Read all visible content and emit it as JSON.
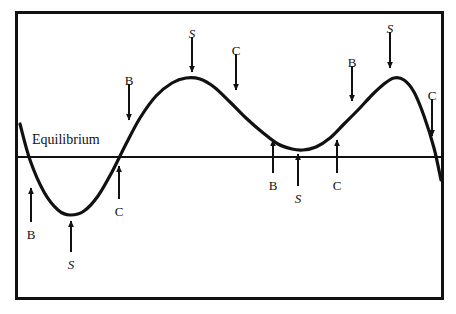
{
  "figure": {
    "title": "",
    "equilibrium_label": "Equilibrium",
    "frame": {
      "x": 15,
      "y": 11,
      "width": 429,
      "height": 289,
      "border_color": "#111111",
      "border_width": 3
    },
    "background_color": "#ffffff",
    "curve_color": "#111111",
    "curve_width": 3,
    "equilibrium_line": {
      "y": 157,
      "x_start": 18,
      "x_end": 441,
      "color": "#111111",
      "width": 2
    }
  },
  "chart_data": {
    "type": "line",
    "title": "",
    "xlabel": "",
    "ylabel": "",
    "grid": false,
    "legend": "none",
    "equilibrium_level": 157,
    "xlim": [
      18,
      441
    ],
    "ylim": [
      11,
      300
    ],
    "series": [
      {
        "name": "market-cycle-wave",
        "path_points": [
          [
            20,
            124
          ],
          [
            30,
            160
          ],
          [
            44,
            192
          ],
          [
            58,
            210
          ],
          [
            70,
            215
          ],
          [
            84,
            211
          ],
          [
            98,
            196
          ],
          [
            112,
            172
          ],
          [
            126,
            144
          ],
          [
            140,
            118
          ],
          [
            156,
            96
          ],
          [
            172,
            83
          ],
          [
            186,
            78
          ],
          [
            200,
            79
          ],
          [
            214,
            87
          ],
          [
            230,
            102
          ],
          [
            246,
            118
          ],
          [
            262,
            132
          ],
          [
            278,
            144
          ],
          [
            292,
            149
          ],
          [
            303,
            150
          ],
          [
            316,
            147
          ],
          [
            330,
            138
          ],
          [
            344,
            124
          ],
          [
            358,
            110
          ],
          [
            372,
            95
          ],
          [
            384,
            84
          ],
          [
            394,
            78
          ],
          [
            404,
            80
          ],
          [
            414,
            92
          ],
          [
            424,
            116
          ],
          [
            434,
            148
          ],
          [
            441,
            180
          ]
        ],
        "features": {
          "first_trough": [
            70,
            215
          ],
          "first_peak": [
            193,
            78
          ],
          "middle_trough": [
            303,
            150
          ],
          "second_peak": [
            394,
            78
          ],
          "crossings": [
            [
              32,
              157
            ],
            [
              113,
              157
            ],
            [
              437,
              157
            ]
          ]
        }
      }
    ],
    "annotations": [
      {
        "id": "a1",
        "label": "B",
        "italic": false,
        "phase": "buy",
        "label_x": 31,
        "label_y": 228,
        "arrow_x": 31,
        "arrow_from_y": 222,
        "arrow_to_y": 188,
        "direction": "up"
      },
      {
        "id": "a2",
        "label": "S",
        "italic": true,
        "phase": "sell",
        "label_x": 71,
        "label_y": 258,
        "arrow_x": 71,
        "arrow_from_y": 252,
        "arrow_to_y": 221,
        "direction": "up"
      },
      {
        "id": "a3",
        "label": "C",
        "italic": false,
        "phase": "cross",
        "label_x": 119,
        "label_y": 205,
        "arrow_x": 119,
        "arrow_from_y": 199,
        "arrow_to_y": 166,
        "direction": "up"
      },
      {
        "id": "a4",
        "label": "B",
        "italic": false,
        "phase": "buy",
        "label_x": 129,
        "label_y": 74,
        "arrow_x": 129,
        "arrow_from_y": 84,
        "arrow_to_y": 120,
        "direction": "down"
      },
      {
        "id": "a5",
        "label": "S",
        "italic": true,
        "phase": "sell",
        "label_x": 192,
        "label_y": 27,
        "arrow_x": 192,
        "arrow_from_y": 37,
        "arrow_to_y": 72,
        "direction": "down"
      },
      {
        "id": "a6",
        "label": "C",
        "italic": false,
        "phase": "cross",
        "label_x": 236,
        "label_y": 44,
        "arrow_x": 236,
        "arrow_from_y": 54,
        "arrow_to_y": 90,
        "direction": "down"
      },
      {
        "id": "a7",
        "label": "B",
        "italic": false,
        "phase": "buy",
        "label_x": 273,
        "label_y": 179,
        "arrow_x": 273,
        "arrow_from_y": 173,
        "arrow_to_y": 140,
        "direction": "up"
      },
      {
        "id": "a8",
        "label": "S",
        "italic": true,
        "phase": "sell",
        "label_x": 298,
        "label_y": 192,
        "arrow_x": 298,
        "arrow_from_y": 186,
        "arrow_to_y": 154,
        "direction": "up"
      },
      {
        "id": "a9",
        "label": "C",
        "italic": false,
        "phase": "cross",
        "label_x": 337,
        "label_y": 179,
        "arrow_x": 337,
        "arrow_from_y": 173,
        "arrow_to_y": 140,
        "direction": "up"
      },
      {
        "id": "a10",
        "label": "B",
        "italic": false,
        "phase": "buy",
        "label_x": 352,
        "label_y": 56,
        "arrow_x": 352,
        "arrow_from_y": 66,
        "arrow_to_y": 101,
        "direction": "down"
      },
      {
        "id": "a11",
        "label": "S",
        "italic": true,
        "phase": "sell",
        "label_x": 390,
        "label_y": 22,
        "arrow_x": 390,
        "arrow_from_y": 32,
        "arrow_to_y": 68,
        "direction": "down"
      },
      {
        "id": "a12",
        "label": "C",
        "italic": false,
        "phase": "cross",
        "label_x": 432,
        "label_y": 89,
        "arrow_x": 432,
        "arrow_from_y": 99,
        "arrow_to_y": 136,
        "direction": "down"
      }
    ]
  }
}
